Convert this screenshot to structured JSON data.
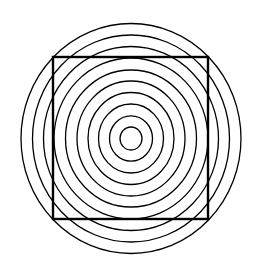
{
  "diagram": {
    "title": "",
    "background": "#ffffff",
    "stroke_color": "#000000",
    "center": {
      "x": 131,
      "y": 138.5
    },
    "rings": {
      "count": 10,
      "stroke_width": 1.3,
      "radii_x": [
        11,
        21.5,
        32.5,
        43,
        54,
        65.5,
        77,
        87.5,
        98.5,
        110
      ],
      "radii_y": [
        11.5,
        22.7,
        34.5,
        46,
        57.5,
        68.5,
        80.5,
        92,
        103.5,
        115
      ]
    },
    "square": {
      "x": 53,
      "y": 57,
      "width": 155,
      "height": 162,
      "stroke_width": 2.4
    }
  }
}
